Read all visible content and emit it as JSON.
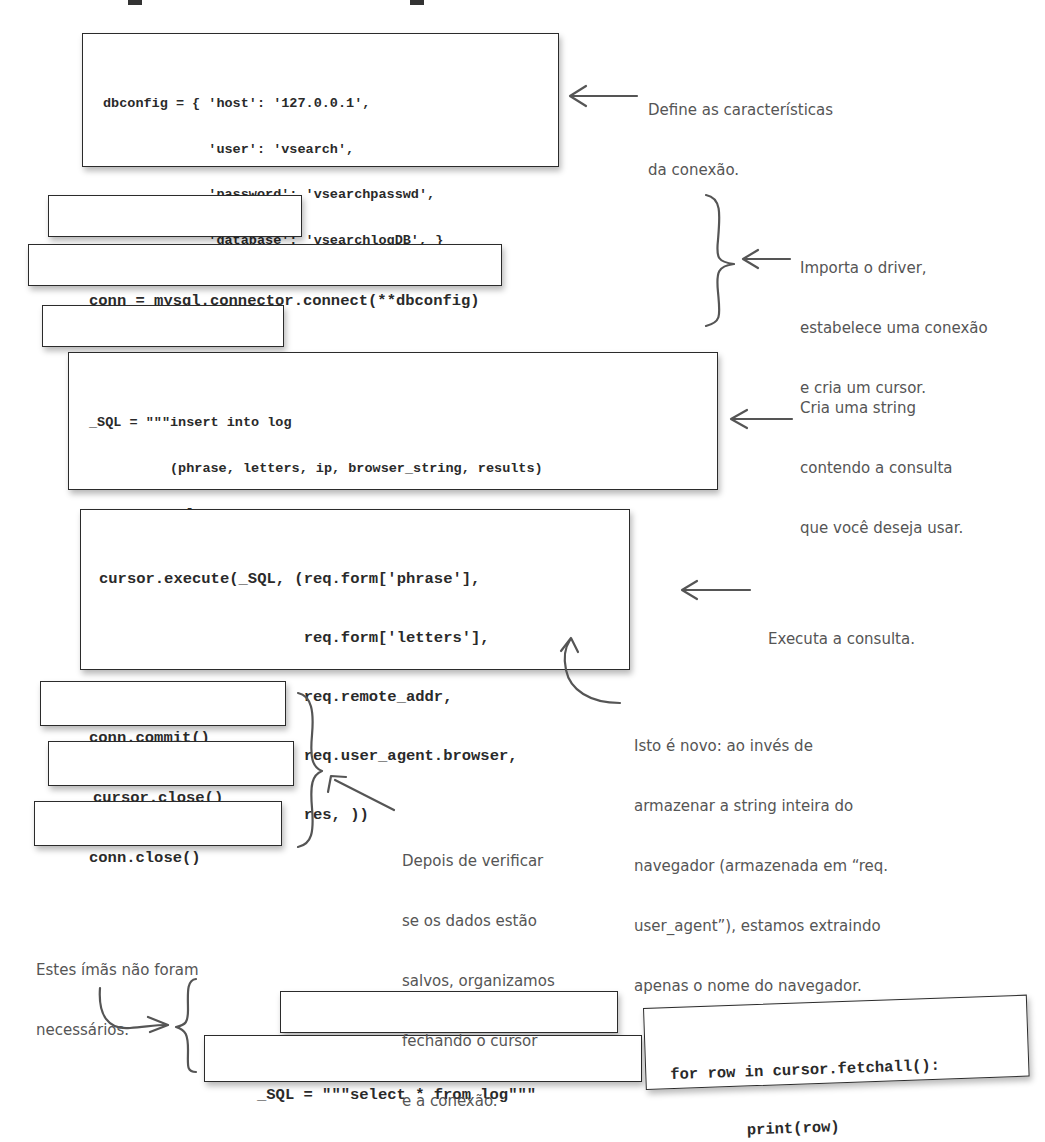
{
  "magnets": {
    "dbconfig": {
      "lines": [
        "dbconfig = { 'host': '127.0.0.1',",
        "             'user': 'vsearch',",
        "             'password': 'vsearchpasswd',",
        "             'database': 'vsearchlogDB', }"
      ]
    },
    "import": {
      "lines": [
        "import mysql.connector"
      ]
    },
    "connect": {
      "lines": [
        "conn = mysql.connector.connect(**dbconfig)"
      ]
    },
    "cursor": {
      "lines": [
        "cursor = conn.cursor()"
      ]
    },
    "sql_insert": {
      "lines": [
        "_SQL = \"\"\"insert into log",
        "          (phrase, letters, ip, browser_string, results)",
        "          values",
        "          (%s, %s, %s, %s, %s)\"\"\""
      ]
    },
    "execute": {
      "lines": [
        "cursor.execute(_SQL, (req.form['phrase'],",
        "                      req.form['letters'],",
        "                      req.remote_addr,",
        "                      req.user_agent.browser,",
        "                      res, ))"
      ]
    },
    "commit": {
      "lines": [
        "conn.commit()"
      ]
    },
    "cursor_close": {
      "lines": [
        "cursor.close()"
      ]
    },
    "conn_close": {
      "lines": [
        "conn.close()"
      ]
    },
    "unused_execute": {
      "lines": [
        "cursor.execute(_SQL)"
      ]
    },
    "unused_select": {
      "lines": [
        "_SQL = \"\"\"select * from log\"\"\""
      ]
    },
    "unused_fetch": {
      "lines": [
        "for row in cursor.fetchall():",
        "        print(row)"
      ]
    }
  },
  "annotations": {
    "dbconfig_note": {
      "lines": [
        "Define as características",
        "da conexão."
      ]
    },
    "connect_note": {
      "lines": [
        "Importa o driver,",
        "estabelece uma conexão",
        "e cria um cursor."
      ]
    },
    "sql_note": {
      "lines": [
        "Cria uma string",
        "contendo a consulta",
        "que você deseja usar."
      ]
    },
    "execute_note": {
      "lines": [
        "Executa a consulta."
      ]
    },
    "browser_note": {
      "lines": [
        "Isto é novo: ao invés de",
        "armazenar a string inteira do",
        "navegador (armazenada em “req.",
        "user_agent”), estamos extraindo",
        "apenas o nome do navegador."
      ]
    },
    "close_note": {
      "lines": [
        "Depois de verificar",
        "se os dados estão",
        "salvos, organizamos",
        "fechando o cursor",
        "e a conexão."
      ]
    },
    "unused_note": {
      "lines": [
        "Estes ímãs não foram",
        "necessários."
      ]
    }
  },
  "colors": {
    "ink": "#2a2a2a",
    "annotation": "#555555",
    "border": "#2b2b2b"
  }
}
